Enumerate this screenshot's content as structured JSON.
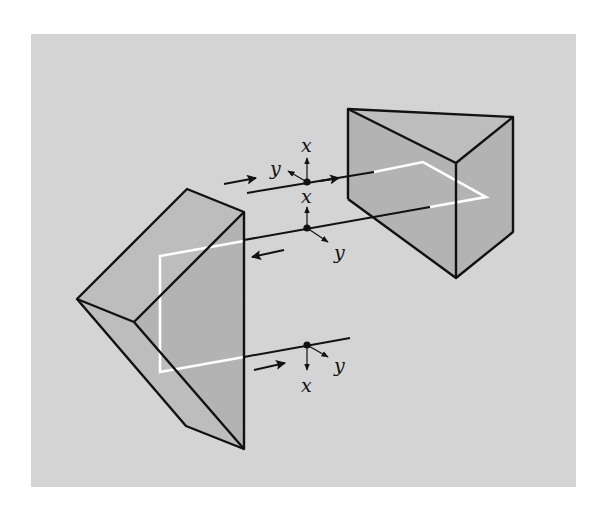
{
  "figure": {
    "colors": {
      "background": "#ffffff",
      "panel": "#d4d4d4",
      "prism_face": "#b3b3b3",
      "edges": "#111111",
      "beam_inside_prism": "#ffffff"
    }
  },
  "labels": {
    "top_x": "x",
    "top_y": "y",
    "middle_x": "x",
    "middle_y": "y",
    "bottom_x": "x",
    "bottom_y": "y"
  },
  "axes_frames": [
    {
      "name": "input",
      "position": "top beam",
      "x_dir": "up",
      "y_dir": "up-left"
    },
    {
      "name": "after-first-prism",
      "position": "middle beam",
      "x_dir": "up",
      "y_dir": "down-right"
    },
    {
      "name": "output",
      "position": "bottom beam",
      "x_dir": "down",
      "y_dir": "down-right"
    }
  ],
  "beam_directions": [
    {
      "beam": "top",
      "arrow": "right"
    },
    {
      "beam": "middle",
      "arrow": "left"
    },
    {
      "beam": "bottom",
      "arrow": "right"
    }
  ]
}
